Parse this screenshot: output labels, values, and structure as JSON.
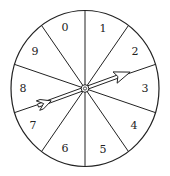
{
  "spinner": {
    "title": "Spinner with 10 equal sections",
    "sections": [
      "0",
      "1",
      "2",
      "3",
      "4",
      "5",
      "6",
      "7",
      "8",
      "9"
    ],
    "pointer_direction": "between 2 and 3",
    "colors": {
      "stroke": "#222222",
      "fill": "#ffffff"
    }
  }
}
